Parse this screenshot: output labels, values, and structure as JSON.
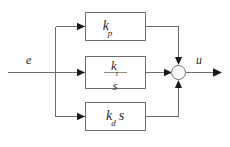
{
  "diagram": {
    "background_color": "#ffffff",
    "line_color": "#6e6e6e",
    "text_color": "#2b2b2b",
    "input": {
      "label": "e",
      "name": "error-signal"
    },
    "output": {
      "label": "u",
      "name": "control-signal"
    },
    "blocks": [
      {
        "id": "proportional",
        "gain_symbol": "k",
        "gain_subscript": "p",
        "trailing": "",
        "type": "gain"
      },
      {
        "id": "integral",
        "numerator_symbol": "k",
        "numerator_subscript": "i",
        "denominator": "s",
        "type": "fraction"
      },
      {
        "id": "derivative",
        "gain_symbol": "k",
        "gain_subscript": "d",
        "trailing": "s",
        "type": "gain"
      }
    ],
    "summing_junction": {
      "name": "summing-junction",
      "shape": "circle",
      "inputs": [
        "top",
        "left",
        "bottom"
      ],
      "sign_labels": []
    }
  }
}
